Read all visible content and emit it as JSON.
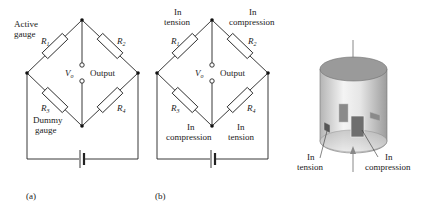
{
  "figure_a": {
    "caption": "(a)",
    "labels": {
      "active_gauge_line1": "Active",
      "active_gauge_line2": "gauge",
      "dummy_gauge_line1": "Dummy",
      "dummy_gauge_line2": "gauge",
      "r1": "R",
      "r1_sub": "1",
      "r2": "R",
      "r2_sub": "2",
      "r3": "R",
      "r3_sub": "3",
      "r4": "R",
      "r4_sub": "4",
      "vo": "V",
      "vo_sub": "o",
      "output": "Output"
    }
  },
  "figure_b": {
    "caption": "(b)",
    "labels": {
      "r1_state_line1": "In",
      "r1_state_line2": "tension",
      "r2_state_line1": "In",
      "r2_state_line2": "compression",
      "r3_state_line1": "In",
      "r3_state_line2": "compression",
      "r4_state_line1": "In",
      "r4_state_line2": "tension",
      "r1": "R",
      "r1_sub": "1",
      "r2": "R",
      "r2_sub": "2",
      "r3": "R",
      "r3_sub": "3",
      "r4": "R",
      "r4_sub": "4",
      "vo": "V",
      "vo_sub": "o",
      "output": "Output"
    }
  },
  "figure_c": {
    "labels": {
      "tension_line1": "In",
      "tension_line2": "tension",
      "compression_line1": "In",
      "compression_line2": "compression"
    },
    "colors": {
      "cylinder_top": "#9a9a9a",
      "cylinder_body_light": "#f2f2f2",
      "cylinder_body_dark": "#a8a8a8",
      "gauge": "#7a7a7a",
      "arrow": "#888888"
    }
  }
}
